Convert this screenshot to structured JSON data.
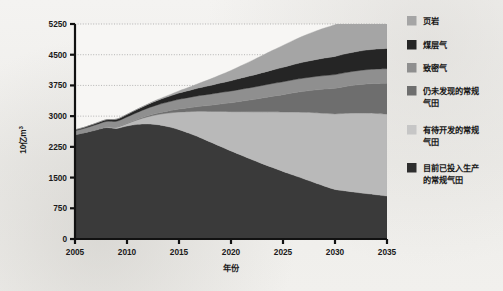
{
  "chart_data": {
    "type": "area",
    "stacked": true,
    "title": "",
    "subtitle": "",
    "xlabel": "年份",
    "ylabel": "10亿m³",
    "ylabel_base": "10亿m",
    "ylabel_exponent": "3",
    "x": [
      2005,
      2006,
      2007,
      2008,
      2009,
      2010,
      2011,
      2012,
      2013,
      2014,
      2015,
      2016,
      2017,
      2018,
      2019,
      2020,
      2021,
      2022,
      2023,
      2024,
      2025,
      2026,
      2027,
      2028,
      2029,
      2030,
      2031,
      2032,
      2033,
      2034,
      2035
    ],
    "xlim": [
      2005,
      2035
    ],
    "ylim": [
      0,
      5250
    ],
    "xticks": [
      "2005",
      "2010",
      "2015",
      "2020",
      "2025",
      "2030",
      "2035"
    ],
    "xtick_values": [
      2005,
      2010,
      2015,
      2020,
      2025,
      2030,
      2035
    ],
    "yticks": [
      "0",
      "750",
      "1500",
      "2250",
      "3000",
      "3750",
      "4500",
      "5250"
    ],
    "ytick_values": [
      0,
      750,
      1500,
      2250,
      3000,
      3750,
      4500,
      5250
    ],
    "grid": "horizontal-dotted",
    "legend_position": "right",
    "stack_order_bottom_to_top": [
      "目前已投入生产的常规气田",
      "有待开发的常规气田",
      "仍未发现的常规气田",
      "致密气",
      "煤层气",
      "页岩"
    ],
    "series": [
      {
        "name": "目前已投入生产的常规气田",
        "color": "#3a3a3a",
        "values": [
          2550,
          2600,
          2660,
          2720,
          2700,
          2760,
          2800,
          2810,
          2790,
          2740,
          2670,
          2580,
          2480,
          2370,
          2260,
          2150,
          2045,
          1940,
          1840,
          1745,
          1650,
          1560,
          1470,
          1380,
          1290,
          1210,
          1175,
          1140,
          1110,
          1080,
          1050
        ]
      },
      {
        "name": "有待开发的常规气田",
        "color": "#b9b9b9",
        "values": [
          0,
          5,
          12,
          20,
          35,
          60,
          110,
          175,
          250,
          335,
          430,
          530,
          640,
          745,
          855,
          960,
          1065,
          1165,
          1265,
          1360,
          1450,
          1540,
          1625,
          1705,
          1780,
          1845,
          1895,
          1935,
          1965,
          1985,
          2000
        ]
      },
      {
        "name": "仍未发现的常规气田",
        "color": "#6e6e6e",
        "values": [
          0,
          0,
          0,
          0,
          0,
          5,
          12,
          22,
          36,
          52,
          72,
          95,
          120,
          150,
          182,
          215,
          255,
          295,
          338,
          382,
          425,
          470,
          512,
          552,
          590,
          625,
          655,
          685,
          712,
          735,
          755
        ]
      },
      {
        "name": "致密气",
        "color": "#8f8f8f",
        "values": [
          95,
          105,
          118,
          130,
          140,
          155,
          170,
          188,
          205,
          222,
          240,
          252,
          262,
          272,
          280,
          288,
          294,
          300,
          305,
          310,
          314,
          318,
          322,
          326,
          330,
          334,
          338,
          342,
          346,
          350,
          352
        ]
      },
      {
        "name": "煤层气",
        "color": "#252525",
        "values": [
          20,
          26,
          34,
          42,
          50,
          62,
          76,
          92,
          110,
          130,
          152,
          172,
          192,
          212,
          232,
          252,
          272,
          292,
          312,
          332,
          352,
          372,
          392,
          410,
          428,
          444,
          458,
          470,
          480,
          488,
          495
        ]
      },
      {
        "name": "页岩",
        "color": "#a5a5a5",
        "values": [
          0,
          0,
          0,
          0,
          0,
          0,
          4,
          10,
          20,
          34,
          52,
          80,
          115,
          155,
          200,
          250,
          305,
          362,
          420,
          478,
          535,
          590,
          642,
          690,
          735,
          775,
          812,
          845,
          872,
          890,
          900
        ]
      }
    ],
    "totals": [
      2665,
      2736,
      2824,
      2912,
      2925,
      3042,
      3172,
      3297,
      3411,
      3513,
      3616,
      3709,
      3809,
      3904,
      4009,
      4115,
      4231,
      4354,
      4480,
      4607,
      4726,
      4850,
      4963,
      5063,
      5153,
      5233,
      5293,
      5417,
      5485,
      5528,
      5552
    ]
  },
  "legend": {
    "items": [
      {
        "label": "页岩",
        "color": "#a5a5a5"
      },
      {
        "label": "煤层气",
        "color": "#252525"
      },
      {
        "label": "致密气",
        "color": "#8f8f8f"
      },
      {
        "label": "仍未发现的常规",
        "label2": "气田",
        "color": "#6e6e6e"
      },
      {
        "label": "有待开发的常规",
        "label2": "气田",
        "color": "#c6c6c6"
      },
      {
        "label": "目前已投入生产",
        "label2": "的常规气田",
        "color": "#2e2e2e"
      }
    ]
  },
  "axes": {
    "y_ticks": [
      "5250",
      "4500",
      "3750",
      "3000",
      "2250",
      "1500",
      "750",
      "0"
    ],
    "x_ticks": [
      "2005",
      "2010",
      "2015",
      "2020",
      "2025",
      "2030",
      "2035"
    ],
    "x_title": "年份",
    "y_title_base": "10亿m",
    "y_title_sup": "3"
  }
}
